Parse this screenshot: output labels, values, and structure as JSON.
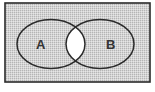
{
  "diagram": {
    "type": "venn",
    "colors": {
      "shade": "#d4d4d4",
      "shade_dot": "#b5b5b5",
      "unshaded": "#ffffff",
      "stroke": "#2a2a2a"
    },
    "universe": {
      "x": 5,
      "y": 3,
      "width": 145,
      "height": 79
    },
    "sets": [
      {
        "id": "A",
        "label": "A",
        "cx": 51,
        "cy": 44,
        "rx": 34,
        "ry": 24.5,
        "label_x": 36,
        "label_y": 49
      },
      {
        "id": "B",
        "label": "B",
        "cx": 100,
        "cy": 44,
        "rx": 34,
        "ry": 24.5,
        "label_x": 106,
        "label_y": 49
      }
    ],
    "unshaded_region": "A∩B"
  }
}
